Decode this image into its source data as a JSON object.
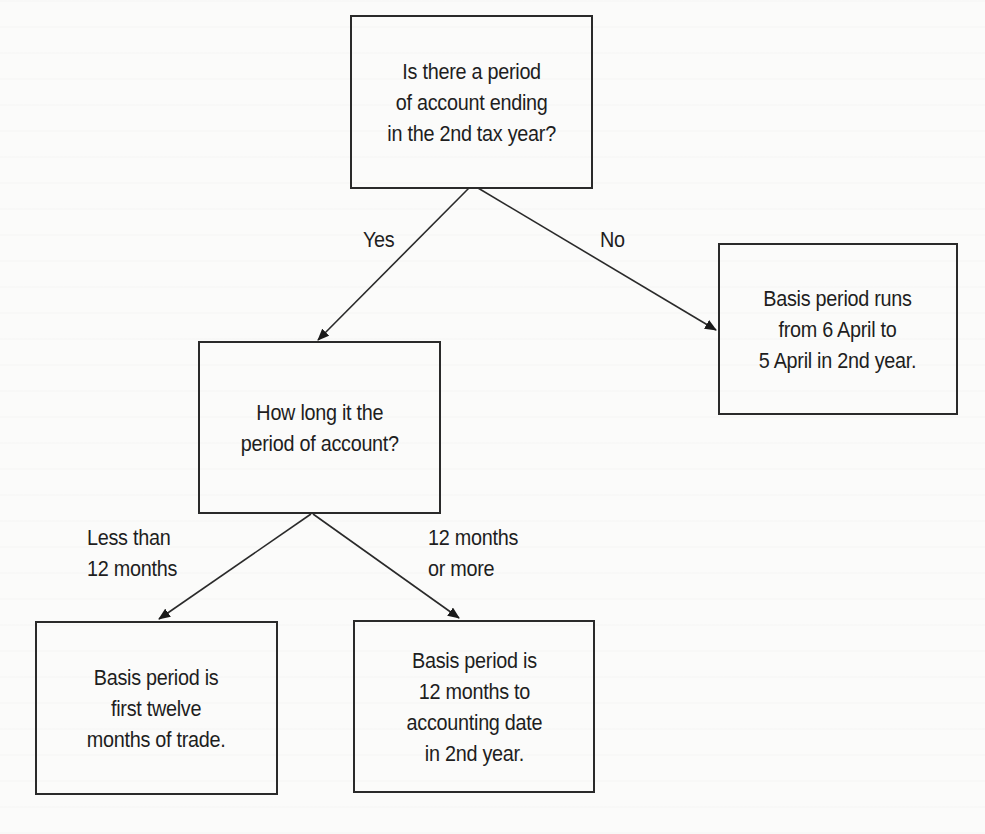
{
  "diagram": {
    "type": "decision-flowchart",
    "nodes": {
      "q1": {
        "kind": "decision",
        "lines": [
          "Is there a period",
          "of account ending",
          "in the 2nd tax year?"
        ]
      },
      "q2": {
        "kind": "decision",
        "lines": [
          "How long it the",
          "period of account?"
        ]
      },
      "r_no": {
        "kind": "outcome",
        "lines": [
          "Basis period runs",
          "from 6 April to",
          "5 April in 2nd year."
        ]
      },
      "r_short": {
        "kind": "outcome",
        "lines": [
          "Basis period is",
          "first twelve",
          "months of trade."
        ]
      },
      "r_long": {
        "kind": "outcome",
        "lines": [
          "Basis period is",
          "12 months to",
          "accounting date",
          "in 2nd year."
        ]
      }
    },
    "edges": {
      "yes": {
        "from": "q1",
        "to": "q2",
        "lines": [
          "Yes"
        ]
      },
      "no": {
        "from": "q1",
        "to": "r_no",
        "lines": [
          "No"
        ]
      },
      "less": {
        "from": "q2",
        "to": "r_short",
        "lines": [
          "Less than",
          "12 months"
        ]
      },
      "more": {
        "from": "q2",
        "to": "r_long",
        "lines": [
          "12 months",
          "or more"
        ]
      }
    }
  },
  "colors": {
    "line": "#2a2a2a",
    "text": "#1e1e1e",
    "background": "#fbfbfa"
  }
}
